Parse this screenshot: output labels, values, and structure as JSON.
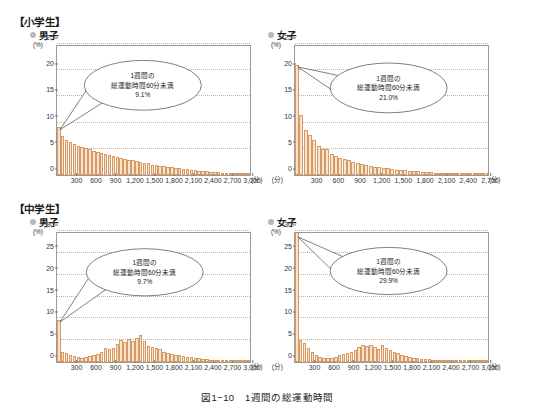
{
  "figure": {
    "caption": "図1−10　1週間の総運動時間",
    "axis_unit_y": "(%)",
    "axis_unit_x": "(分)"
  },
  "sections": [
    {
      "title": "【小学生】"
    },
    {
      "title": "【中学生】"
    }
  ],
  "charts": [
    {
      "id": "elementary-boys",
      "group": "【小学生】",
      "series_label": "男子",
      "callout": {
        "line1": "1週間の",
        "line2": "総運動時間60分未満",
        "line3": "9.1%"
      },
      "chart_data": {
        "type": "bar",
        "title": "小学生 男子 1週間の総運動時間",
        "xlabel": "(分)",
        "ylabel": "(%)",
        "xlim": [
          0,
          3000
        ],
        "ylim": [
          0,
          25
        ],
        "ytick_labels": [
          "0",
          "5",
          "10",
          "15",
          "20",
          "25"
        ],
        "yticks": [
          0,
          5,
          10,
          15,
          20,
          25
        ],
        "xtick_labels": [
          "300",
          "600",
          "900",
          "1,200",
          "1,500",
          "1,800",
          "2,100",
          "2,400",
          "2,700",
          "3,000"
        ],
        "xticks": [
          300,
          600,
          900,
          1200,
          1500,
          1800,
          2100,
          2400,
          2700,
          3000
        ],
        "grid": true,
        "bin_width": 60,
        "bin_starts": [
          0,
          60,
          120,
          180,
          240,
          300,
          360,
          420,
          480,
          540,
          600,
          660,
          720,
          780,
          840,
          900,
          960,
          1020,
          1080,
          1140,
          1200,
          1260,
          1320,
          1380,
          1440,
          1500,
          1560,
          1620,
          1680,
          1740,
          1800,
          1860,
          1920,
          1980,
          2040,
          2100,
          2160,
          2220,
          2280,
          2340,
          2400,
          2460,
          2520,
          2580,
          2640,
          2700,
          2760,
          2820,
          2880,
          2940
        ],
        "values": [
          9.1,
          7.4,
          6.6,
          6.3,
          6.0,
          5.6,
          5.4,
          5.1,
          4.9,
          4.6,
          4.4,
          4.2,
          4.0,
          3.8,
          3.6,
          3.4,
          3.2,
          3.1,
          2.9,
          2.8,
          2.6,
          2.5,
          2.3,
          2.2,
          2.0,
          1.9,
          1.8,
          1.7,
          1.6,
          1.5,
          1.4,
          1.3,
          1.2,
          1.1,
          1.0,
          0.9,
          0.85,
          0.75,
          0.7,
          0.6,
          0.55,
          0.5,
          0.45,
          0.4,
          0.35,
          0.3,
          0.28,
          0.25,
          0.22,
          0.2
        ],
        "annotations": [
          {
            "text": "1週間の総運動時間60分未満 9.1%",
            "x": 30,
            "y": 9.1
          }
        ]
      }
    },
    {
      "id": "elementary-girls",
      "group": "【小学生】",
      "series_label": "女子",
      "callout": {
        "line1": "1週間の",
        "line2": "総運動時間60分未満",
        "line3": "21.0%"
      },
      "chart_data": {
        "type": "bar",
        "title": "小学生 女子 1週間の総運動時間",
        "xlabel": "(分)",
        "ylabel": "(%)",
        "xlim": [
          0,
          2700
        ],
        "ylim": [
          0,
          25
        ],
        "ytick_labels": [
          "0",
          "5",
          "10",
          "15",
          "20",
          "25"
        ],
        "yticks": [
          0,
          5,
          10,
          15,
          20,
          25
        ],
        "xtick_labels": [
          "300",
          "600",
          "900",
          "1,200",
          "1,500",
          "1,800",
          "2,100",
          "2,400",
          "2,700"
        ],
        "xticks": [
          300,
          600,
          900,
          1200,
          1500,
          1800,
          2100,
          2400,
          2700
        ],
        "grid": true,
        "bin_width": 60,
        "bin_starts": [
          0,
          60,
          120,
          180,
          240,
          300,
          360,
          420,
          480,
          540,
          600,
          660,
          720,
          780,
          840,
          900,
          960,
          1020,
          1080,
          1140,
          1200,
          1260,
          1320,
          1380,
          1440,
          1500,
          1560,
          1620,
          1680,
          1740,
          1800,
          1860,
          1920,
          1980,
          2040,
          2100,
          2160,
          2220,
          2280,
          2340,
          2400,
          2460,
          2520,
          2580,
          2640
        ],
        "values": [
          21.0,
          11.5,
          8.6,
          7.6,
          6.6,
          5.6,
          5.0,
          4.9,
          4.0,
          3.6,
          3.3,
          3.0,
          2.8,
          2.5,
          2.3,
          2.1,
          1.9,
          1.8,
          1.6,
          1.5,
          1.35,
          1.25,
          1.15,
          1.05,
          0.95,
          0.9,
          0.8,
          0.75,
          0.7,
          0.62,
          0.58,
          0.52,
          0.48,
          0.44,
          0.4,
          0.36,
          0.33,
          0.3,
          0.27,
          0.25,
          0.22,
          0.2,
          0.18,
          0.16,
          0.14
        ],
        "annotations": [
          {
            "text": "1週間の総運動時間60分未満 21.0%",
            "x": 30,
            "y": 21.0
          }
        ]
      }
    },
    {
      "id": "juniorhigh-boys",
      "group": "【中学生】",
      "series_label": "男子",
      "callout": {
        "line1": "1週間の",
        "line2": "総運動時間60分未満",
        "line3": "9.7%"
      },
      "chart_data": {
        "type": "bar",
        "title": "中学生 男子 1週間の総運動時間",
        "xlabel": "(分)",
        "ylabel": "(%)",
        "xlim": [
          0,
          3000
        ],
        "ylim": [
          0,
          30
        ],
        "ytick_labels": [
          "0",
          "5",
          "10",
          "15",
          "20",
          "25",
          "30"
        ],
        "yticks": [
          0,
          5,
          10,
          15,
          20,
          25,
          30
        ],
        "xtick_labels": [
          "300",
          "600",
          "900",
          "1,200",
          "1,500",
          "1,800",
          "2,100",
          "2,400",
          "2,700",
          "3,000"
        ],
        "xticks": [
          300,
          600,
          900,
          1200,
          1500,
          1800,
          2100,
          2400,
          2700,
          3000
        ],
        "grid": true,
        "bin_width": 60,
        "bin_starts": [
          0,
          60,
          120,
          180,
          240,
          300,
          360,
          420,
          480,
          540,
          600,
          660,
          720,
          780,
          840,
          900,
          960,
          1020,
          1080,
          1140,
          1200,
          1260,
          1320,
          1380,
          1440,
          1500,
          1560,
          1620,
          1680,
          1740,
          1800,
          1860,
          1920,
          1980,
          2040,
          2100,
          2160,
          2220,
          2280,
          2340,
          2400,
          2460,
          2520,
          2580,
          2640,
          2700,
          2760,
          2820,
          2880,
          2940
        ],
        "values": [
          9.7,
          2.4,
          2.0,
          1.6,
          1.3,
          1.1,
          1.0,
          1.1,
          1.3,
          1.5,
          1.8,
          2.4,
          3.3,
          2.9,
          3.3,
          4.2,
          5.0,
          4.5,
          5.2,
          4.8,
          5.6,
          6.1,
          4.9,
          3.6,
          3.4,
          3.2,
          2.9,
          2.3,
          2.0,
          1.8,
          1.6,
          1.5,
          1.4,
          1.2,
          1.1,
          1.0,
          0.85,
          0.7,
          0.62,
          0.55,
          0.45,
          0.4,
          0.34,
          0.3,
          0.26,
          0.22,
          0.2,
          0.17,
          0.15,
          0.12
        ],
        "annotations": [
          {
            "text": "1週間の総運動時間60分未満 9.7%",
            "x": 30,
            "y": 9.7
          }
        ]
      }
    },
    {
      "id": "juniorhigh-girls",
      "group": "【中学生】",
      "series_label": "女子",
      "callout": {
        "line1": "1週間の",
        "line2": "総運動時間60分未満",
        "line3": "29.9%"
      },
      "chart_data": {
        "type": "bar",
        "title": "中学生 女子 1週間の総運動時間",
        "xlabel": "(分)",
        "ylabel": "(%)",
        "xlim": [
          0,
          3000
        ],
        "ylim": [
          0,
          30
        ],
        "ytick_labels": [
          "0",
          "5",
          "10",
          "15",
          "20",
          "25",
          "30"
        ],
        "yticks": [
          0,
          5,
          10,
          15,
          20,
          25,
          30
        ],
        "xtick_labels": [
          "300",
          "600",
          "900",
          "1,200",
          "1,500",
          "1,800",
          "2,100",
          "2,400",
          "2,700",
          "3,000"
        ],
        "xticks": [
          300,
          600,
          900,
          1200,
          1500,
          1800,
          2100,
          2400,
          2700,
          3000
        ],
        "grid": true,
        "bin_width": 60,
        "bin_starts": [
          0,
          60,
          120,
          180,
          240,
          300,
          360,
          420,
          480,
          540,
          600,
          660,
          720,
          780,
          840,
          900,
          960,
          1020,
          1080,
          1140,
          1200,
          1260,
          1320,
          1380,
          1440,
          1500,
          1560,
          1620,
          1680,
          1740,
          1800,
          1860,
          1920,
          1980,
          2040,
          2100,
          2160,
          2220,
          2280,
          2340,
          2400,
          2460,
          2520,
          2580,
          2640,
          2700,
          2760,
          2820,
          2880,
          2940
        ],
        "values": [
          29.9,
          5.1,
          4.3,
          3.1,
          2.3,
          1.7,
          1.2,
          1.0,
          0.9,
          1.0,
          1.2,
          1.5,
          1.8,
          2.1,
          2.3,
          2.7,
          3.4,
          3.8,
          3.6,
          4.0,
          3.5,
          2.9,
          4.0,
          3.2,
          2.8,
          2.4,
          2.1,
          1.7,
          1.4,
          1.2,
          1.0,
          0.85,
          0.75,
          0.7,
          0.62,
          0.55,
          0.5,
          0.42,
          0.36,
          0.32,
          0.28,
          0.25,
          0.22,
          0.18,
          0.16,
          0.14,
          0.12,
          0.1,
          0.09,
          0.08
        ],
        "annotations": [
          {
            "text": "1週間の総運動時間60分未満 29.9%",
            "x": 30,
            "y": 29.9
          }
        ]
      }
    }
  ],
  "colors": {
    "bar_fill": "#f7e3cf",
    "bar_stroke": "#d79a63",
    "grid": "#c9a88c",
    "frame": "#9a9a9a",
    "bullet": "#b9b9b9",
    "text": "#231f20"
  }
}
